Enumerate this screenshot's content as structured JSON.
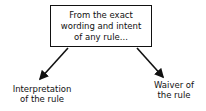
{
  "diagram": {
    "source_box": {
      "text": "From the exact\nwording and intent\nof any rule..."
    },
    "branches": [
      {
        "label": "Interpretation\nof the rule",
        "direction": "down-left"
      },
      {
        "label": "Waiver of\nthe rule",
        "direction": "down-right"
      }
    ],
    "colors": {
      "line": "#111111",
      "background": "#ffffff"
    }
  }
}
